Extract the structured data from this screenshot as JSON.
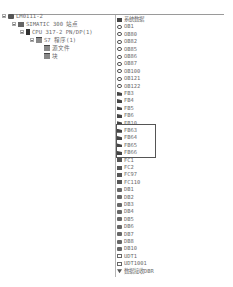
{
  "tree": {
    "items": [
      {
        "label": "LM0111-2",
        "level": 0,
        "icon": "project-icon",
        "expanded": true
      },
      {
        "label": "SIMATIC 300 站点",
        "level": 1,
        "icon": "station-icon",
        "expanded": true
      },
      {
        "label": "CPU 317-2 PN/DP(1)",
        "level": 2,
        "icon": "cpu-icon",
        "expanded": true
      },
      {
        "label": "S7 程序(1)",
        "level": 3,
        "icon": "program-folder-icon",
        "expanded": true
      },
      {
        "label": "源文件",
        "level": 4,
        "icon": "sources-folder-icon"
      },
      {
        "label": "块",
        "level": 4,
        "icon": "blocks-folder-icon"
      }
    ]
  },
  "blocks": {
    "items": [
      {
        "label": "系统数据",
        "type": "sys"
      },
      {
        "label": "OB1",
        "type": "ob"
      },
      {
        "label": "OB80",
        "type": "ob"
      },
      {
        "label": "OB82",
        "type": "ob"
      },
      {
        "label": "OB85",
        "type": "ob"
      },
      {
        "label": "OB86",
        "type": "ob"
      },
      {
        "label": "OB87",
        "type": "ob"
      },
      {
        "label": "OB100",
        "type": "ob"
      },
      {
        "label": "OB121",
        "type": "ob"
      },
      {
        "label": "OB122",
        "type": "ob"
      },
      {
        "label": "FB3",
        "type": "fb"
      },
      {
        "label": "FB4",
        "type": "fb"
      },
      {
        "label": "FB5",
        "type": "fb"
      },
      {
        "label": "FB6",
        "type": "fb"
      },
      {
        "label": "FB10",
        "type": "fb"
      },
      {
        "label": "FB63",
        "type": "fb"
      },
      {
        "label": "FB64",
        "type": "fb"
      },
      {
        "label": "FB65",
        "type": "fb"
      },
      {
        "label": "FB66",
        "type": "fb"
      },
      {
        "label": "FC1",
        "type": "fc"
      },
      {
        "label": "FC2",
        "type": "fc"
      },
      {
        "label": "FC97",
        "type": "fc"
      },
      {
        "label": "FC110",
        "type": "fc"
      },
      {
        "label": "DB1",
        "type": "db"
      },
      {
        "label": "DB2",
        "type": "db"
      },
      {
        "label": "DB3",
        "type": "db"
      },
      {
        "label": "DB4",
        "type": "db"
      },
      {
        "label": "DB5",
        "type": "db"
      },
      {
        "label": "DB6",
        "type": "db"
      },
      {
        "label": "DB7",
        "type": "db"
      },
      {
        "label": "DB8",
        "type": "db"
      },
      {
        "label": "DB10",
        "type": "db"
      },
      {
        "label": "UDT1",
        "type": "udt"
      },
      {
        "label": "UDT1001",
        "type": "udt"
      },
      {
        "label": "数据接收DBR",
        "type": "dbr"
      }
    ],
    "highlighted": [
      "FB63",
      "FB64",
      "FB65",
      "FB66"
    ]
  }
}
